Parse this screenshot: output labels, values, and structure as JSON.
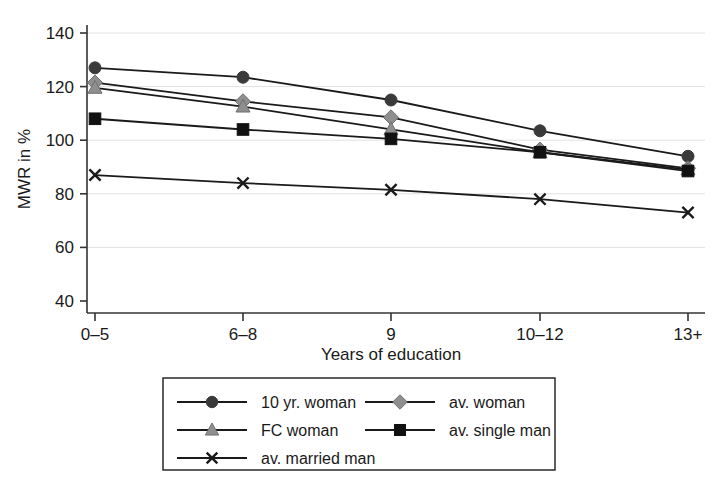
{
  "chart_data": {
    "type": "line",
    "title": "",
    "xlabel": "Years of education",
    "ylabel": "MWR in %",
    "categories": [
      "0–5",
      "6–8",
      "9",
      "10–12",
      "13+"
    ],
    "x_tick_labels": [
      "0–5",
      "6–8",
      "9",
      "10–12",
      "13+"
    ],
    "y_tick_labels": [
      "40",
      "60",
      "80",
      "100",
      "120",
      "140"
    ],
    "y_ticks": [
      40,
      60,
      80,
      100,
      120,
      140
    ],
    "ylim": [
      36,
      145
    ],
    "grid": "horizontal",
    "legend_position": "below-center",
    "series": [
      {
        "name": "10 yr. woman",
        "marker": "circle",
        "marker_color": "#3a3a3a",
        "line_color": "#1a1a1a",
        "values": [
          127,
          123.5,
          115,
          103.5,
          94
        ]
      },
      {
        "name": "av. woman",
        "marker": "diamond",
        "marker_color": "#8f8f8f",
        "line_color": "#1a1a1a",
        "values": [
          121.5,
          114.5,
          108.5,
          96.5,
          89.5
        ]
      },
      {
        "name": "FC woman",
        "marker": "triangle",
        "marker_color": "#8f8f8f",
        "line_color": "#1a1a1a",
        "values": [
          119.5,
          112.5,
          104,
          95.5,
          89
        ]
      },
      {
        "name": "av. single man",
        "marker": "square",
        "marker_color": "#111111",
        "line_color": "#1a1a1a",
        "values": [
          108,
          104,
          100.5,
          95.5,
          88.5
        ]
      },
      {
        "name": "av. married man",
        "marker": "x",
        "marker_color": "#1a1a1a",
        "line_color": "#1a1a1a",
        "values": [
          87,
          84,
          81.5,
          78,
          73
        ]
      }
    ],
    "legend_entries": [
      {
        "label": "10 yr. woman",
        "marker": "circle",
        "color": "#3a3a3a",
        "col": 0,
        "row": 0
      },
      {
        "label": "av. woman",
        "marker": "diamond",
        "color": "#8f8f8f",
        "col": 1,
        "row": 0
      },
      {
        "label": "FC woman",
        "marker": "triangle",
        "color": "#8f8f8f",
        "col": 0,
        "row": 1
      },
      {
        "label": "av. single man",
        "marker": "square",
        "color": "#111111",
        "col": 1,
        "row": 1
      },
      {
        "label": "av. married man",
        "marker": "x",
        "color": "#1a1a1a",
        "col": 0,
        "row": 2
      }
    ],
    "colors": {
      "axis": "#333333",
      "grid": "#e2e2e2",
      "line": "#1a1a1a",
      "background": "#ffffff"
    }
  }
}
